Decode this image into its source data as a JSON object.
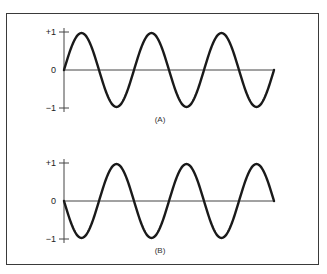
{
  "figure": {
    "panels": [
      {
        "id": "A",
        "label": "(A)",
        "y_ticks": [
          "+1",
          "0",
          "−1"
        ],
        "phase": "sine",
        "cycles": 3
      },
      {
        "id": "B",
        "label": "(B)",
        "y_ticks": [
          "+1",
          "0",
          "−1"
        ],
        "phase": "inverted-sine",
        "cycles": 3
      }
    ],
    "colors": {
      "wave": "#1a1a1a",
      "axis": "#444444",
      "frame": "#3a3a3a"
    }
  }
}
